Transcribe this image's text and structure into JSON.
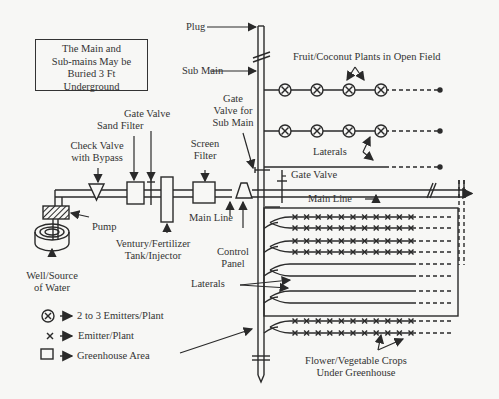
{
  "note_box": {
    "lines": [
      "The Main and",
      "Sub-mains May be",
      "Buried 3 Ft",
      "Underground"
    ]
  },
  "labels": {
    "plug": "Plug",
    "sub_main": "Sub Main",
    "fruit_plants": "Fruit/Coconut Plants in Open Field",
    "gate_valve_sub_main": [
      "Gate",
      "Valve for",
      "Sub Main"
    ],
    "gate_valve_top": "Gate Valve",
    "sand_filter": "Sand Filter",
    "check_valve": [
      "Check Valve",
      "with Bypass"
    ],
    "screen_filter": [
      "Screen",
      "Filter"
    ],
    "laterals_top": "Laterals",
    "gate_valve_right": "Gate Valve",
    "main_line_right": "Main Line",
    "main_line_left": "Main Line",
    "pump": "Pump",
    "venturi": [
      "Ventury/Fertilizer",
      "Tank/Injector"
    ],
    "control_panel": [
      "Control",
      "Panel"
    ],
    "well": [
      "Well/Source",
      "of Water"
    ],
    "laterals_bottom": "Laterals",
    "crops": [
      "Flower/Vegetable Crops",
      "Under Greenhouse"
    ]
  },
  "legend": [
    {
      "icon": "circle-x-icon",
      "label": "2 to 3 Emitters/Plant"
    },
    {
      "icon": "x-icon",
      "label": "Emitter/Plant"
    },
    {
      "icon": "square-icon",
      "label": "Greenhouse Area"
    }
  ],
  "layout_counts": {
    "open_field_plants_per_lateral": 4,
    "open_field_planted_laterals": 2,
    "greenhouse_emitters_per_lateral": 11
  },
  "colors": {
    "line": "#2a2a2a",
    "background": "#f7f7f5"
  }
}
